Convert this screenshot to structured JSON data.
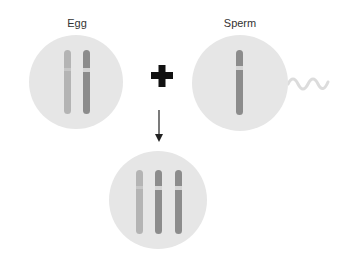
{
  "diagram": {
    "egg": {
      "label": "Egg"
    },
    "sperm": {
      "label": "Sperm"
    },
    "operator": "+",
    "result": {
      "label": ""
    }
  },
  "colors": {
    "cell_fill": "#e6e6e6",
    "chromosome_light": "#b4b4b4",
    "chromosome_dark": "#8a8a8a",
    "centromere": "#d8d8d8",
    "plus": "#111111",
    "arrow": "#222222",
    "tail": "#dcdcdc"
  }
}
